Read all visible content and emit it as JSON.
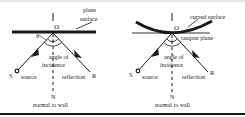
{
  "figure": {
    "left_panel": {
      "title": "plane surface",
      "label_line1": "plane",
      "label_line2": "surface",
      "point_O": "O",
      "point_S": "S",
      "point_R": "R",
      "point_N": "N",
      "angle_symbol_alpha": "α",
      "angle_label_line1": "angle of",
      "angle_label_line2": "incidence",
      "source_label": "source",
      "reflection_label": "reflection",
      "normal_label": "normal to wall"
    },
    "right_panel": {
      "title": "curved surface",
      "label_curved": "curved surface",
      "label_tangent": "tangent plane",
      "point_O": "O",
      "point_S": "S",
      "point_R": "R",
      "point_N": "N",
      "angle_label_line1": "angle of",
      "angle_label_line2": "incidence",
      "source_label": "source",
      "reflection_label": "reflection",
      "normal_label": "normal to wall"
    },
    "colors": {
      "ink": "#1a1a1a",
      "background": "#ffffff"
    }
  }
}
